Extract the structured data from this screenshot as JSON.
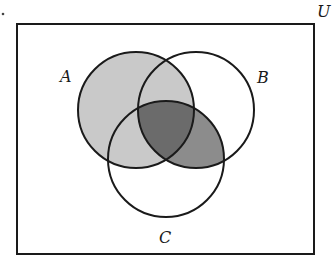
{
  "diagram": {
    "type": "venn",
    "universe_label": "U",
    "sets": [
      {
        "name": "A",
        "label": "A",
        "cx": 136,
        "cy": 110,
        "r": 58
      },
      {
        "name": "B",
        "label": "B",
        "cx": 196,
        "cy": 110,
        "r": 58
      },
      {
        "name": "C",
        "label": "C",
        "cx": 166,
        "cy": 159,
        "r": 58
      }
    ],
    "shading": {
      "description": "A shaded light gray; B∩C shaded medium gray; A∩B∩C darkest",
      "light_region": "A",
      "medium_region": "B∩C",
      "dark_region": "A∩B∩C"
    },
    "colors": {
      "light": "#c9c9c9",
      "medium": "#8c8c8c",
      "dark": "#6b6b6b",
      "stroke": "#1a1a1a"
    },
    "universe_rect": {
      "x": 17,
      "y": 24,
      "width": 297,
      "height": 230
    },
    "stray_mark": "."
  }
}
